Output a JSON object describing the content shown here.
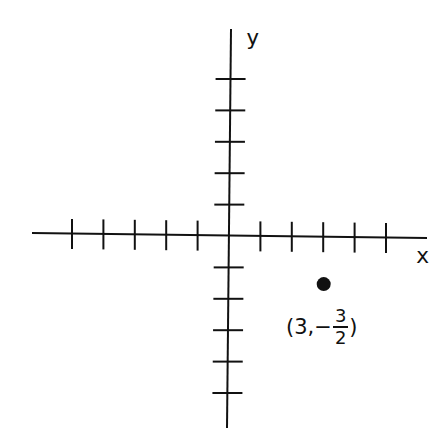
{
  "chart_data": {
    "type": "scatter",
    "title": "",
    "xlabel": "x",
    "ylabel": "y",
    "xlim": [
      -6,
      6
    ],
    "ylim": [
      -6,
      6
    ],
    "grid": false,
    "x_ticks": [
      -5,
      -4,
      -3,
      -2,
      -1,
      1,
      2,
      3,
      4,
      5
    ],
    "y_ticks": [
      -5,
      -4,
      -3,
      -2,
      -1,
      1,
      2,
      3,
      4,
      5
    ],
    "tick_labels_shown": false,
    "points": [
      {
        "x": 3,
        "y": -1.5,
        "label": "(3,-3/2)"
      }
    ]
  },
  "axes": {
    "x_label": "x",
    "y_label": "y"
  },
  "point_label": {
    "open": "(",
    "x": "3",
    "sep": ",",
    "sign": "−",
    "numerator": "3",
    "denominator": "2",
    "close": ")"
  },
  "colors": {
    "ink": "#111111",
    "background": "#ffffff"
  }
}
